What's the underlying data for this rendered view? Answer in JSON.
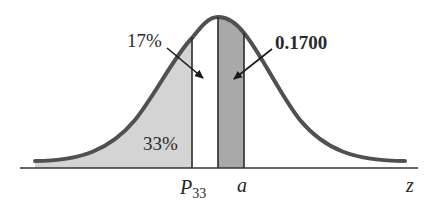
{
  "diagram": {
    "type": "normal-distribution-curve",
    "axis_label": "z",
    "markers": [
      {
        "label_main": "P",
        "label_sub": "33",
        "position": "left of mean"
      },
      {
        "label_main": "a",
        "position": "right of mean"
      }
    ],
    "regions": [
      {
        "label": "33%",
        "description": "left tail area up to P33",
        "fill": "#d4d4d4"
      },
      {
        "label": "17%",
        "description": "area between P33 and mean (unshaded)",
        "fill": "#ffffff"
      },
      {
        "label": "0.1700",
        "description": "area between mean and a",
        "fill": "#a9a9a9"
      }
    ],
    "annotations": {
      "left_arrow_label": "17%",
      "right_arrow_label": "0.1700",
      "tail_label": "33%"
    },
    "colors": {
      "curve": "#505050",
      "axis": "#333333",
      "light_fill": "#d4d4d4",
      "dark_fill": "#a9a9a9"
    }
  }
}
